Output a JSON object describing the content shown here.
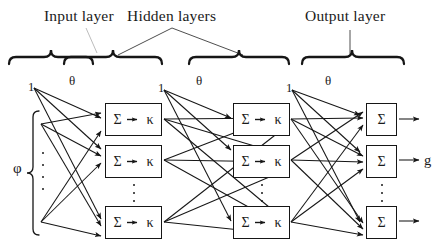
{
  "diagram": {
    "type": "neural-network-architecture",
    "background_color": "#ffffff",
    "ink_color": "#161616"
  },
  "headers": {
    "input": "Input layer",
    "hidden": "Hidden layers",
    "output": "Output layer"
  },
  "layers": [
    {
      "id": "input",
      "kind": "input",
      "bracket_label": "φ",
      "node_count_shown": 2,
      "ellipsis": true
    },
    {
      "id": "hidden-1",
      "kind": "hidden",
      "cell_sum": "Σ",
      "cell_activation": "κ",
      "node_count_shown": 3,
      "ellipsis": true
    },
    {
      "id": "hidden-2",
      "kind": "hidden",
      "cell_sum": "Σ",
      "cell_activation": "κ",
      "node_count_shown": 3,
      "ellipsis": true
    },
    {
      "id": "output",
      "kind": "output",
      "cell_sum": "Σ",
      "node_count_shown": 3,
      "ellipsis": true,
      "output_label": "g"
    }
  ],
  "bias_nodes": [
    {
      "id": "bias-1",
      "label": "1"
    },
    {
      "id": "bias-2",
      "label": "1"
    },
    {
      "id": "bias-3",
      "label": "1"
    }
  ],
  "weight_labels": [
    {
      "id": "theta-1",
      "label": "θ"
    },
    {
      "id": "theta-2",
      "label": "θ"
    },
    {
      "id": "theta-3",
      "label": "θ"
    }
  ],
  "symbols": {
    "sum": "Σ",
    "kappa": "κ",
    "phi": "φ",
    "theta": "θ",
    "output": "g",
    "bias": "1"
  },
  "braces": [
    {
      "id": "brace-input",
      "spans": "input-layer"
    },
    {
      "id": "brace-hidden-1",
      "spans": "hidden-layer-1"
    },
    {
      "id": "brace-hidden-2",
      "spans": "hidden-layer-2"
    },
    {
      "id": "brace-output",
      "spans": "output-layer"
    }
  ]
}
